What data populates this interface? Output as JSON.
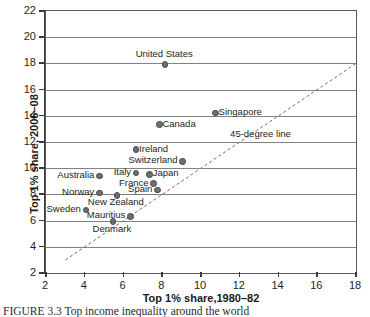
{
  "chart_data": {
    "type": "scatter",
    "title": "",
    "xlabel": "Top 1% share,1980–82",
    "ylabel": "Top 1% share, 2006–08",
    "xlim": [
      2,
      18
    ],
    "ylim": [
      2,
      22
    ],
    "xticks": [
      2,
      4,
      6,
      8,
      10,
      12,
      14,
      16,
      18
    ],
    "yticks": [
      2,
      4,
      6,
      8,
      10,
      12,
      14,
      16,
      18,
      20,
      22
    ],
    "grid": "horizontal",
    "legend": "none",
    "annotations": [
      {
        "text": "45-degree line",
        "x": 13.0,
        "y": 12.6
      }
    ],
    "reference_line": {
      "name": "45-degree line",
      "style": "dashed",
      "from": [
        3,
        3
      ],
      "to": [
        18,
        18
      ]
    },
    "points": [
      {
        "label": "United States",
        "x": 8.1,
        "y": 18.0,
        "label_pos": "above"
      },
      {
        "label": "Singapore",
        "x": 10.7,
        "y": 14.3,
        "label_pos": "right"
      },
      {
        "label": "Canada",
        "x": 7.8,
        "y": 13.4,
        "label_pos": "right"
      },
      {
        "label": "Ireland",
        "x": 6.6,
        "y": 11.5,
        "label_pos": "right"
      },
      {
        "label": "Switzerland",
        "x": 9.0,
        "y": 10.6,
        "label_pos": "left"
      },
      {
        "label": "Italy",
        "x": 6.6,
        "y": 9.7,
        "label_pos": "left"
      },
      {
        "label": "Japan",
        "x": 7.3,
        "y": 9.6,
        "label_pos": "right"
      },
      {
        "label": "France",
        "x": 7.5,
        "y": 8.9,
        "label_pos": "left"
      },
      {
        "label": "Spain",
        "x": 7.7,
        "y": 8.4,
        "label_pos": "left"
      },
      {
        "label": "Australia",
        "x": 4.7,
        "y": 9.5,
        "label_pos": "left"
      },
      {
        "label": "Norway",
        "x": 4.7,
        "y": 8.2,
        "label_pos": "left"
      },
      {
        "label": "New Zealand",
        "x": 5.6,
        "y": 8.0,
        "label_pos": "below"
      },
      {
        "label": "Sweden",
        "x": 4.0,
        "y": 6.9,
        "label_pos": "left"
      },
      {
        "label": "Mauritius",
        "x": 6.3,
        "y": 6.4,
        "label_pos": "left"
      },
      {
        "label": "Denmark",
        "x": 5.4,
        "y": 6.0,
        "label_pos": "below"
      }
    ]
  },
  "caption": {
    "figure_number": "FIGURE 3.3",
    "text": "Top income inequality around the world"
  }
}
